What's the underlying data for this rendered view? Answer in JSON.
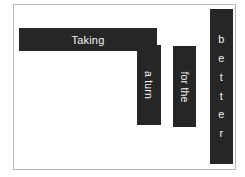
{
  "canvas": {
    "width": 245,
    "height": 177,
    "background_color": "#ffffff"
  },
  "panel": {
    "background_color": "#ffffff",
    "border_color": "#b9b9b9"
  },
  "edge_marks": {
    "top_dash_color": "#231f20",
    "bottom_dash_color": "#231f20"
  },
  "headline": {
    "full_text": "Taking a turn for the better",
    "bar_color": "#262626",
    "text_color": "#f2f2f2",
    "segments": [
      {
        "id": "taking",
        "label": "Taking",
        "orientation": "horizontal"
      },
      {
        "id": "aturn",
        "label": "a turn",
        "orientation": "rotated-90-cw"
      },
      {
        "id": "forthe",
        "label": "for the",
        "orientation": "rotated-90-cw"
      },
      {
        "id": "better",
        "label": "b\ne\nt\nt\ne\nr",
        "orientation": "stacked-upright"
      }
    ]
  }
}
